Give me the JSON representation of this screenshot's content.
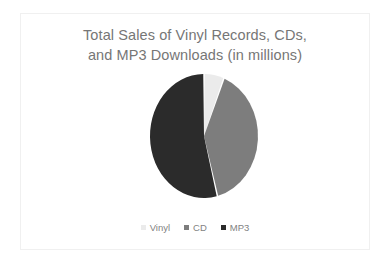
{
  "chart_data": {
    "type": "pie",
    "title": "Total Sales of Vinyl Records, CDs, and MP3 Downloads (in millions)",
    "title_lines": [
      "Total Sales of Vinyl Records, CDs,",
      "and MP3 Downloads (in millions)"
    ],
    "categories": [
      "Vinyl",
      "CD",
      "MP3"
    ],
    "values": [
      6,
      40,
      54
    ],
    "unit": "millions",
    "colors": [
      "#ebebeb",
      "#7d7d7d",
      "#2b2b2b"
    ],
    "legend_position": "bottom",
    "legend_marker": "square",
    "start_angle_deg": 0,
    "direction": "clockwise",
    "grid": false,
    "xlabel": "",
    "ylabel": "",
    "slices": [
      {
        "label": "Vinyl",
        "value": 6,
        "color": "#ebebeb"
      },
      {
        "label": "CD",
        "value": 40,
        "color": "#7d7d7d"
      },
      {
        "label": "MP3",
        "value": 54,
        "color": "#2b2b2b"
      }
    ]
  },
  "style": {
    "background": "#ffffff",
    "frame_border": "#f0f0f0",
    "title_color": "#767676",
    "legend_text_color": "#828282",
    "slice_gap_color": "#ffffff"
  }
}
